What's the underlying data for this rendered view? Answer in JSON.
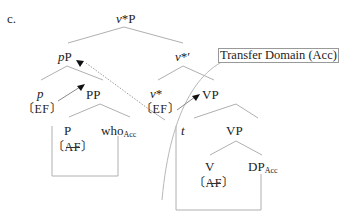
{
  "example_label": "c.",
  "nodes": {
    "root": {
      "cat": "v",
      "rest": "*P"
    },
    "pP": {
      "head": "p",
      "rest": "P"
    },
    "v_bar": {
      "cat": "v",
      "rest": "*′"
    },
    "p": {
      "text": "p",
      "feature": "EF"
    },
    "PP": {
      "text": "PP"
    },
    "v_star": {
      "cat": "v",
      "rest": "*",
      "feature": "EF"
    },
    "VP_upper": {
      "text": "VP"
    },
    "P": {
      "text": "P",
      "feature": "AF",
      "feature_struck": true
    },
    "who": {
      "text": "who",
      "subscript": "Acc"
    },
    "t": {
      "text": "t"
    },
    "VP_lower": {
      "text": "VP"
    },
    "V": {
      "text": "V",
      "feature": "AF",
      "feature_struck": true
    },
    "DP": {
      "text": "DP",
      "subscript": "Acc"
    }
  },
  "annotation": {
    "label": "Transfer Domain (Acc)"
  },
  "brackets": {
    "open": "〔",
    "close": "〕"
  },
  "colors": {
    "line": "#aaaaaa",
    "text": "#222222",
    "arrow": "#111111"
  }
}
